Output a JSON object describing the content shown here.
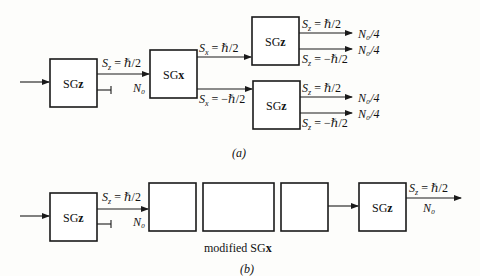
{
  "part_a": {
    "caption": "(a)",
    "sg1": {
      "label_main": "SG",
      "label_axis": "z"
    },
    "sg1_out_label": "S_z = ℏ/2",
    "sg1_out_label_parts": {
      "s": "S",
      "sub": "z",
      "rest": " = ℏ/2"
    },
    "sg2_in_count": "N₀",
    "sg2": {
      "label_main": "SG",
      "label_axis": "x"
    },
    "sg2_up_label": {
      "s": "S",
      "sub": "x",
      "rest": " = ℏ/2"
    },
    "sg2_down_label": {
      "s": "S",
      "sub": "x",
      "rest": " = −ℏ/2"
    },
    "sg3_upper": {
      "label_main": "SG",
      "label_axis": "z",
      "up_label": {
        "s": "S",
        "sub": "z",
        "rest": " = ℏ/2"
      },
      "down_label": {
        "s": "S",
        "sub": "z",
        "rest": " = −ℏ/2"
      },
      "up_count": "N₀/4",
      "down_count": "N₀/4"
    },
    "sg3_lower": {
      "label_main": "SG",
      "label_axis": "z",
      "up_label": {
        "s": "S",
        "sub": "z",
        "rest": " = ℏ/2"
      },
      "down_label": {
        "s": "S",
        "sub": "z",
        "rest": " = −ℏ/2"
      },
      "up_count": "N₀/4",
      "down_count": "N₀/4"
    }
  },
  "part_b": {
    "caption": "(b)",
    "sg1": {
      "label_main": "SG",
      "label_axis": "z"
    },
    "sg1_out_label": {
      "s": "S",
      "sub": "z",
      "rest": " = ℏ/2"
    },
    "in_count": "N₀",
    "modified_label_main": "modified SG",
    "modified_label_axis": "x",
    "sg_final": {
      "label_main": "SG",
      "label_axis": "z"
    },
    "final_out_label": {
      "s": "S",
      "sub": "z",
      "rest": " = ℏ/2"
    },
    "final_count": "N₀"
  }
}
